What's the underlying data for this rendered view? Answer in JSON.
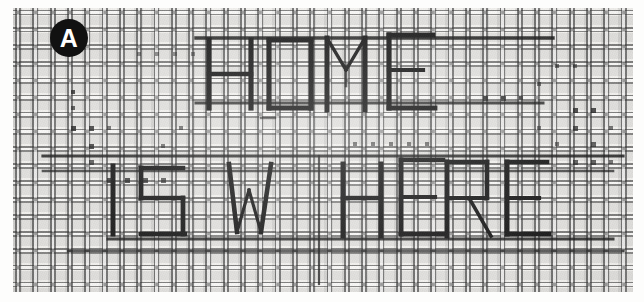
{
  "figure": {
    "panel_label": "A",
    "caption_lines": [
      "HOME",
      "IS WHERE"
    ],
    "full_text": "HOME IS WHERE",
    "line_1": "HOME",
    "line_2": "IS WHERE"
  },
  "colors": {
    "panel_label_background": "#111111",
    "panel_label_text": "#ffffff",
    "ink_stroke": "#1c1c1c",
    "mesh_wire": "#3a3a3a",
    "mesh_gap": "#f2f1ee",
    "page_background": "#ffffff"
  },
  "mesh": {
    "weave": "plain-woven",
    "warp_pitch_px": 17.3,
    "weft_pitch_px": 17.0
  },
  "letters": {
    "line1": [
      "H",
      "O",
      "M",
      "E"
    ],
    "line2": [
      "I",
      "S",
      "W",
      "H",
      "E",
      "R",
      "E"
    ]
  }
}
